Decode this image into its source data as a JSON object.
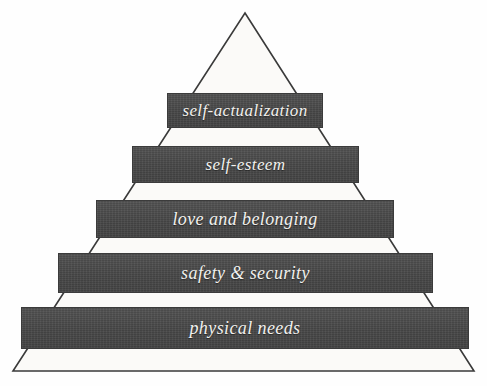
{
  "diagram": {
    "type": "pyramid",
    "background_color": "#fefefe",
    "outline_color": "#3a3a3a",
    "band_fill_color": "#4b4b4b",
    "band_text_color": "#f2f1ee",
    "tiers": [
      {
        "level": 5,
        "label": "self-actualization",
        "position": "top"
      },
      {
        "level": 4,
        "label": "self-esteem",
        "position": "upper-middle"
      },
      {
        "level": 3,
        "label": "love and belonging",
        "position": "middle"
      },
      {
        "level": 2,
        "label": "safety & security",
        "position": "lower-middle"
      },
      {
        "level": 1,
        "label": "physical needs",
        "position": "base"
      }
    ]
  }
}
